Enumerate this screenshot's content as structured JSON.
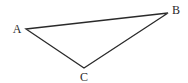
{
  "diagram": {
    "type": "triangle",
    "stroke_color": "#2a2a2a",
    "background": "#ffffff",
    "vertices": [
      {
        "label": "A",
        "x": 26,
        "y": 29,
        "label_x": 17,
        "label_y": 33
      },
      {
        "label": "B",
        "x": 168,
        "y": 13,
        "label_x": 176,
        "label_y": 14
      },
      {
        "label": "C",
        "x": 84,
        "y": 68,
        "label_x": 84,
        "label_y": 81
      }
    ],
    "edges": [
      {
        "from": "A",
        "to": "B"
      },
      {
        "from": "B",
        "to": "C"
      },
      {
        "from": "C",
        "to": "A"
      }
    ]
  }
}
